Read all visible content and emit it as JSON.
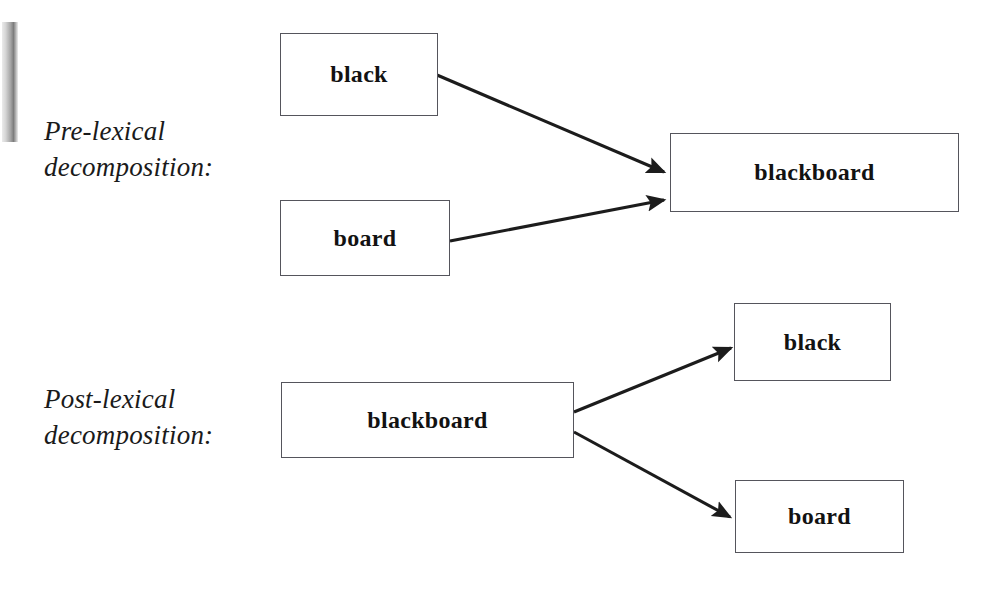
{
  "figure": {
    "type": "diagram",
    "subtype": "flow-diagram",
    "background_color": "#ffffff",
    "box_border_color": "#55555c",
    "arrow_color": "#1c1c1c",
    "text_color": "#121212"
  },
  "sections": [
    {
      "id": "pre-lexical",
      "caption": "Pre-lexical\ndecomposition:",
      "caption_line1": "Pre-lexical",
      "caption_line2": "decomposition:",
      "direction": "constituents-to-whole",
      "source_nodes": [
        "black",
        "board"
      ],
      "target_nodes": [
        "blackboard"
      ]
    },
    {
      "id": "post-lexical",
      "caption": "Post-lexical\ndecomposition:",
      "caption_line1": "Post-lexical",
      "caption_line2": "decomposition:",
      "direction": "whole-to-constituents",
      "source_nodes": [
        "blackboard"
      ],
      "target_nodes": [
        "black",
        "board"
      ]
    }
  ],
  "nodes": [
    {
      "id": "pre-black",
      "label": "black",
      "section": "pre-lexical",
      "x": 280,
      "y": 33,
      "w": 158,
      "h": 83
    },
    {
      "id": "pre-board",
      "label": "board",
      "section": "pre-lexical",
      "x": 280,
      "y": 200,
      "w": 170,
      "h": 76
    },
    {
      "id": "pre-blackboard",
      "label": "blackboard",
      "section": "pre-lexical",
      "x": 670,
      "y": 133,
      "w": 289,
      "h": 79
    },
    {
      "id": "post-blackboard",
      "label": "blackboard",
      "section": "post-lexical",
      "x": 281,
      "y": 382,
      "w": 293,
      "h": 76
    },
    {
      "id": "post-black",
      "label": "black",
      "section": "post-lexical",
      "x": 734,
      "y": 303,
      "w": 157,
      "h": 78
    },
    {
      "id": "post-board",
      "label": "board",
      "section": "post-lexical",
      "x": 735,
      "y": 480,
      "w": 169,
      "h": 73
    }
  ],
  "arrows": [
    {
      "id": "arrow-black-to-blackboard",
      "from": "pre-black",
      "to": "pre-blackboard",
      "x1": 437,
      "y1": 75,
      "x2": 664,
      "y2": 172
    },
    {
      "id": "arrow-board-to-blackboard",
      "from": "pre-board",
      "to": "pre-blackboard",
      "x1": 450,
      "y1": 241,
      "x2": 664,
      "y2": 200
    },
    {
      "id": "arrow-blackboard-to-black",
      "from": "post-blackboard",
      "to": "post-black",
      "x1": 574,
      "y1": 412,
      "x2": 731,
      "y2": 348
    },
    {
      "id": "arrow-blackboard-to-board",
      "from": "post-blackboard",
      "to": "post-board",
      "x1": 574,
      "y1": 432,
      "x2": 730,
      "y2": 517
    }
  ],
  "labels": {
    "black": "black",
    "board": "board",
    "blackboard": "blackboard"
  }
}
